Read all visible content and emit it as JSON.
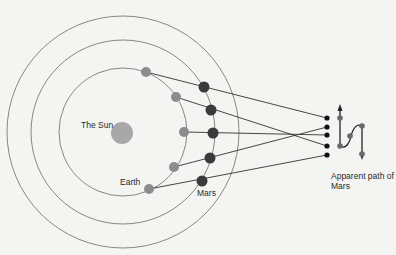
{
  "labels": {
    "sun": "The Sun",
    "earth": "Earth",
    "mars": "Mars",
    "apparent_path_line1": "Apparent path of",
    "apparent_path_line2": "Mars"
  },
  "colors": {
    "background": "#f4f4f2",
    "orbit": "#6a6a6a",
    "sun": "#a8a8a8",
    "earth": "#8c8c8c",
    "mars": "#3a3a3a",
    "sightline": "#333333",
    "path_dot": "#111111"
  },
  "geometry": {
    "center": [
      123,
      132
    ],
    "orbit_radii": [
      64,
      92,
      116
    ],
    "sun_radius": 11,
    "earth_positions": [
      [
        146,
        72
      ],
      [
        176,
        97
      ],
      [
        184,
        132
      ],
      [
        174,
        167
      ],
      [
        149,
        189
      ]
    ],
    "mars_positions": [
      [
        204,
        87
      ],
      [
        211,
        110
      ],
      [
        213,
        133
      ],
      [
        210,
        158
      ],
      [
        202,
        181
      ]
    ],
    "projected_points": [
      [
        327,
        118
      ],
      [
        327,
        146
      ],
      [
        327,
        135
      ],
      [
        327,
        127
      ],
      [
        327,
        155
      ]
    ]
  }
}
